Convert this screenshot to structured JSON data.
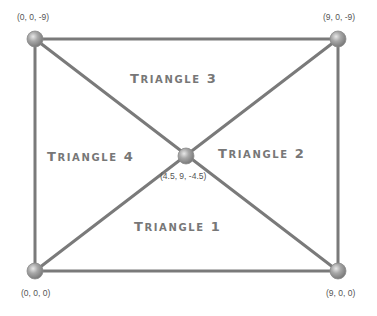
{
  "diagram": {
    "vertices": [
      {
        "id": "top-left",
        "label": "(0, 0, -9)",
        "x": 35,
        "y": 39
      },
      {
        "id": "top-right",
        "label": "(9, 0, -9)",
        "x": 338,
        "y": 39
      },
      {
        "id": "bottom-left",
        "label": "(0, 0, 0)",
        "x": 35,
        "y": 271
      },
      {
        "id": "bottom-right",
        "label": "(9, 0, 0)",
        "x": 338,
        "y": 271
      },
      {
        "id": "center",
        "label": "(4.5, 9, -4.5)",
        "x": 186,
        "y": 156
      }
    ],
    "triangles": [
      {
        "first": "T",
        "rest": "RIANGLE",
        "num": "1",
        "label": "Triangle 1"
      },
      {
        "first": "T",
        "rest": "RIANGLE",
        "num": "2",
        "label": "Triangle 2"
      },
      {
        "first": "T",
        "rest": "RIANGLE",
        "num": "3",
        "label": "Triangle 3"
      },
      {
        "first": "T",
        "rest": "RIANGLE",
        "num": "4",
        "label": "Triangle 4"
      }
    ],
    "colors": {
      "edge": "#777777",
      "node": "#a6a6a6",
      "label": "#777777",
      "coord": "#555555"
    }
  }
}
